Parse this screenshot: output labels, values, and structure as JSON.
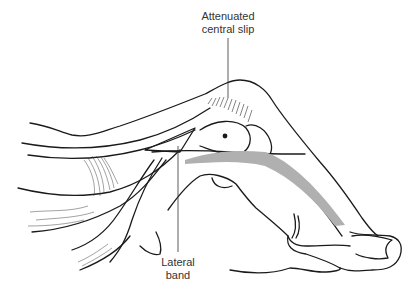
{
  "diagram": {
    "labels": {
      "central_slip": {
        "line1": "Attenuated",
        "line2": "central slip"
      },
      "lateral_band": {
        "line1": "Lateral",
        "line2": "band"
      }
    },
    "colors": {
      "outline": "#1a1a1a",
      "band_fill": "#b0b0b0",
      "label_text": "#333333",
      "background": "#ffffff"
    }
  }
}
